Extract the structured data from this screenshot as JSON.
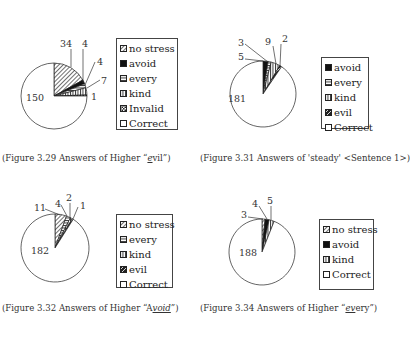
{
  "chart_data": [
    {
      "type": "pie",
      "title": "(Figure 3.29 Answers of Higher \"evil\")",
      "caption": {
        "before": "(Figure 3.29 Answers of Higher “",
        "underlined": "e",
        "after": "vil”)"
      },
      "categories": [
        "no stress",
        "avoid",
        "every",
        "kind",
        "Invalid",
        "Correct"
      ],
      "values": [
        34,
        4,
        4,
        7,
        1,
        150
      ],
      "legend_position": "right",
      "geometry": {
        "cx": 54,
        "cy": 96,
        "r": 33,
        "legend": [
          116,
          38,
          62,
          92
        ],
        "caption": [
          2,
          153
        ]
      },
      "labels": [
        {
          "text": "34",
          "x": 60,
          "y": 47,
          "lx1": 71,
          "ly1": 49,
          "lx2": 71,
          "ly2": 67
        },
        {
          "text": "4",
          "x": 82,
          "y": 47,
          "lx1": 83,
          "ly1": 49,
          "lx2": 83,
          "ly2": 83
        },
        {
          "text": "4",
          "x": 97,
          "y": 65,
          "lx1": 95,
          "ly1": 62,
          "lx2": 85,
          "ly2": 85
        },
        {
          "text": "7",
          "x": 101,
          "y": 84,
          "lx1": 100,
          "ly1": 80,
          "lx2": 87,
          "ly2": 88
        },
        {
          "text": "1",
          "x": 91,
          "y": 100,
          "lx1": 0,
          "ly1": 0,
          "lx2": 0,
          "ly2": 0
        },
        {
          "text": "150",
          "x": 26,
          "y": 101,
          "lx1": 0,
          "ly1": 0,
          "lx2": 0,
          "ly2": 0
        }
      ]
    },
    {
      "type": "pie",
      "title": "(Figure 3.31 Answers of 'steady' <Sentence 1>)",
      "caption": {
        "before": "(Figure 3.31 Answers of 'steady' <Sentence 1>)",
        "underlined": "",
        "after": ""
      },
      "categories": [
        "avoid",
        "every",
        "kind",
        "evil",
        "Correct"
      ],
      "values": [
        5,
        3,
        9,
        2,
        181
      ],
      "legend_position": "right",
      "geometry": {
        "cx": 263,
        "cy": 94,
        "r": 33,
        "legend": [
          321,
          57,
          48,
          72
        ],
        "caption": [
          200,
          153
        ]
      },
      "labels": [
        {
          "text": "3",
          "x": 238,
          "y": 46,
          "lx1": 245,
          "ly1": 44,
          "lx2": 268,
          "ly2": 62
        },
        {
          "text": "5",
          "x": 238,
          "y": 60,
          "lx1": 245,
          "ly1": 59,
          "lx2": 263,
          "ly2": 61
        },
        {
          "text": "9",
          "x": 265,
          "y": 45,
          "lx1": 273,
          "ly1": 46,
          "lx2": 276,
          "ly2": 64
        },
        {
          "text": "2",
          "x": 282,
          "y": 42,
          "lx1": 281,
          "ly1": 44,
          "lx2": 280,
          "ly2": 66
        },
        {
          "text": "181",
          "x": 228,
          "y": 102,
          "lx1": 0,
          "ly1": 0,
          "lx2": 0,
          "ly2": 0
        }
      ]
    },
    {
      "type": "pie",
      "title": "(Figure 3.32 Answers of Higher \"Avoid\")",
      "caption": {
        "before": "(Figure 3.32 Answers of Higher “A",
        "underlined": "void",
        "after": "”)"
      },
      "categories": [
        "no stress",
        "every",
        "kind",
        "evil",
        "Correct"
      ],
      "values": [
        11,
        4,
        2,
        1,
        182
      ],
      "legend_position": "right",
      "geometry": {
        "cx": 55,
        "cy": 248,
        "r": 34,
        "legend": [
          116,
          214,
          57,
          74
        ],
        "caption": [
          2,
          303
        ]
      },
      "labels": [
        {
          "text": "11",
          "x": 34,
          "y": 211,
          "lx1": 45,
          "ly1": 209,
          "lx2": 60,
          "ly2": 215
        },
        {
          "text": "4",
          "x": 55,
          "y": 207,
          "lx1": 61,
          "ly1": 205,
          "lx2": 67,
          "ly2": 216
        },
        {
          "text": "2",
          "x": 66,
          "y": 201,
          "lx1": 70,
          "ly1": 203,
          "lx2": 70,
          "ly2": 218
        },
        {
          "text": "1",
          "x": 80,
          "y": 209,
          "lx1": 78,
          "ly1": 207,
          "lx2": 73,
          "ly2": 219
        },
        {
          "text": "182",
          "x": 31,
          "y": 254,
          "lx1": 0,
          "ly1": 0,
          "lx2": 0,
          "ly2": 0
        }
      ]
    },
    {
      "type": "pie",
      "title": "(Figure 3.34 Answers of Higher \"every\")",
      "caption": {
        "before": "(Figure 3.34 Answers of Higher “",
        "underlined": "ev",
        "after": "ery”)"
      },
      "categories": [
        "no stress",
        "avoid",
        "kind",
        "Correct"
      ],
      "values": [
        3,
        4,
        5,
        188
      ],
      "legend_position": "right",
      "geometry": {
        "cx": 262,
        "cy": 252,
        "r": 33,
        "legend": [
          319,
          219,
          55,
          71
        ],
        "caption": [
          200,
          303
        ]
      },
      "labels": [
        {
          "text": "3",
          "x": 241,
          "y": 218,
          "lx1": 248,
          "ly1": 217,
          "lx2": 263,
          "ly2": 219
        },
        {
          "text": "4",
          "x": 252,
          "y": 207,
          "lx1": 259,
          "ly1": 206,
          "lx2": 267,
          "ly2": 219
        },
        {
          "text": "5",
          "x": 267,
          "y": 204,
          "lx1": 271,
          "ly1": 206,
          "lx2": 271,
          "ly2": 220
        },
        {
          "text": "188",
          "x": 239,
          "y": 256,
          "lx1": 0,
          "ly1": 0,
          "lx2": 0,
          "ly2": 0
        }
      ]
    }
  ],
  "patterns": {
    "no stress": "diag",
    "avoid": "solid",
    "every": "hlines",
    "kind": "vlines",
    "Invalid": "check",
    "evil": "halfblack",
    "Correct": "white"
  },
  "colors": {
    "ink": "#222222",
    "background": "#ffffff"
  }
}
